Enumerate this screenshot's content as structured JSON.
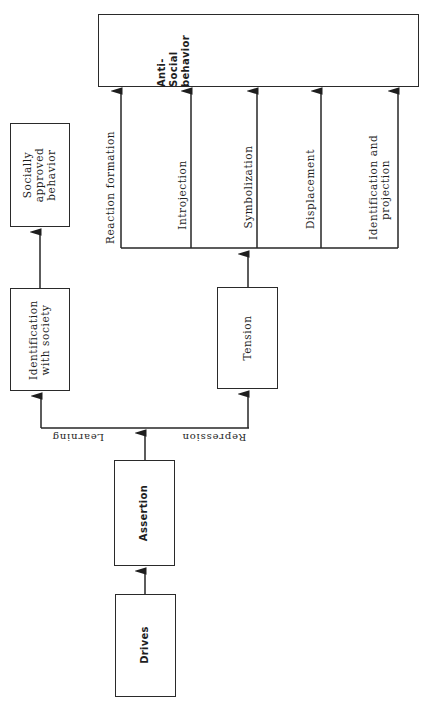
{
  "diagram": {
    "nodes": {
      "drives": {
        "label": "Drives"
      },
      "assertion": {
        "label": "Assertion"
      },
      "identification_with_society": {
        "line1": "Identification",
        "line2": "with society"
      },
      "socially_approved_behavior": {
        "line1": "Socially",
        "line2": "approved",
        "line3": "behavior"
      },
      "tension": {
        "label": "Tension"
      },
      "anti_social_behavior": {
        "line1": "Anti-",
        "line2": "Social",
        "line3": "behavior"
      }
    },
    "edge_labels": {
      "learning": "Learning",
      "repression": "Repression"
    },
    "mechanisms": [
      {
        "label": "Reaction formation"
      },
      {
        "label": "Introjection"
      },
      {
        "label": "Symbolization"
      },
      {
        "label": "Displacement"
      },
      {
        "label": "Identification and",
        "label2": "projection"
      }
    ],
    "edges": [
      [
        "Drives",
        "Assertion"
      ],
      [
        "Assertion",
        "Learning/Repression split"
      ],
      [
        "Learning",
        "Identification with society"
      ],
      [
        "Identification with society",
        "Socially approved behavior"
      ],
      [
        "Repression",
        "Tension"
      ],
      [
        "Tension",
        "Defense mechanisms"
      ],
      [
        "Defense mechanisms",
        "Anti-Social behavior"
      ]
    ]
  }
}
